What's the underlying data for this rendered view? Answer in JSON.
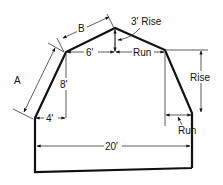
{
  "diagram": {
    "labels": {
      "side_a": "A",
      "side_b": "B",
      "upper_run": "6'",
      "upper_rise": "3' Rise",
      "knee_height": "8'",
      "upper_right_run": "Run",
      "lower_right_rise": "Rise",
      "lower_left_run": "4'",
      "lower_right_run": "Run",
      "overall_width": "20'"
    }
  }
}
